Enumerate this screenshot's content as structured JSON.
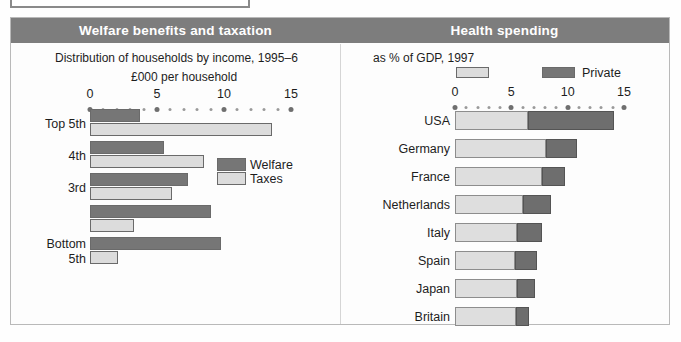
{
  "figure": {
    "panels": [
      {
        "id": "welfare",
        "title": "Welfare benefits and taxation"
      },
      {
        "id": "health",
        "title": "Health spending"
      }
    ]
  },
  "left_panel": {
    "subtitle": "Distribution of households by income, 1995–6",
    "axis_unit": "£000 per household",
    "legend": [
      {
        "label": "Welfare",
        "swatch": "dark"
      },
      {
        "label": "Taxes",
        "swatch": "light"
      }
    ]
  },
  "right_panel": {
    "subtitle": "as % of GDP, 1997",
    "legend": [
      {
        "label": "",
        "swatch": "light"
      },
      {
        "label": "Private",
        "swatch": "dark"
      }
    ]
  },
  "colors": {
    "band": "#7d7d7d",
    "dark_series": "#767676",
    "light_series": "#dcdcdc",
    "text": "#1d1d1d",
    "frame": "#b9b9b9"
  },
  "chart_data": [
    {
      "type": "bar",
      "id": "welfare-benefits-and-taxation",
      "title": "Welfare benefits and taxation",
      "subtitle": "Distribution of households by income, 1995–6",
      "orientation": "horizontal",
      "grouped": true,
      "xlabel": "£000 per household",
      "ylabel": "",
      "xlim": [
        0,
        15
      ],
      "xticks": [
        0,
        5,
        10,
        15
      ],
      "xticklabels": [
        "0",
        "5",
        "10",
        "15"
      ],
      "grid": false,
      "legend_position": "inside-right",
      "categories": [
        "Top 5th",
        "4th",
        "3rd",
        "",
        "Bottom 5th"
      ],
      "series": [
        {
          "name": "Welfare",
          "color": "#767676",
          "values": [
            3.7,
            5.5,
            7.3,
            9.0,
            9.8
          ]
        },
        {
          "name": "Taxes",
          "color": "#dcdcdc",
          "values": [
            13.6,
            8.5,
            6.1,
            3.3,
            2.1
          ]
        }
      ]
    },
    {
      "type": "bar",
      "id": "health-spending",
      "title": "Health spending",
      "subtitle": "as % of GDP, 1997",
      "orientation": "horizontal",
      "stacked": true,
      "xlabel": "",
      "ylabel": "",
      "xlim": [
        0,
        15
      ],
      "xticks": [
        0,
        5,
        10,
        15
      ],
      "xticklabels": [
        "0",
        "5",
        "10",
        "15"
      ],
      "grid": false,
      "legend_position": "top",
      "categories": [
        "USA",
        "Germany",
        "France",
        "Netherlands",
        "Italy",
        "Spain",
        "Japan",
        "Britain"
      ],
      "series": [
        {
          "name": "",
          "color": "#dcdcdc",
          "values": [
            6.5,
            8.1,
            7.7,
            6.0,
            5.5,
            5.3,
            5.5,
            5.4
          ]
        },
        {
          "name": "Private",
          "color": "#767676",
          "values": [
            7.6,
            2.7,
            2.1,
            2.5,
            2.2,
            2.0,
            1.6,
            1.2
          ]
        }
      ]
    }
  ]
}
